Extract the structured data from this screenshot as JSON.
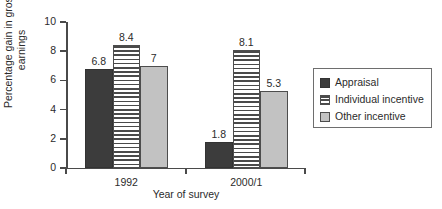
{
  "chart_data": {
    "type": "bar",
    "title": "",
    "subtitle": "",
    "xlabel": "Year of survey",
    "ylabel": "Percentage gain in gross\nearnings",
    "categories": [
      "1992",
      "2000/1"
    ],
    "series": [
      {
        "name": "Appraisal",
        "values": [
          6.8,
          1.8
        ],
        "labels": [
          "6.8",
          "1.8"
        ],
        "pattern": "solid",
        "color": "#3c3c3c"
      },
      {
        "name": "Individual incentive",
        "values": [
          8.4,
          8.1
        ],
        "labels": [
          "8.4",
          "8.1"
        ],
        "pattern": "horizontal-stripes",
        "color": "#4a4a4a"
      },
      {
        "name": "Other incentive",
        "values": [
          7,
          5.3
        ],
        "labels": [
          "7",
          "5.3"
        ],
        "pattern": "solid",
        "color": "#c2c2c2"
      }
    ],
    "ylim": [
      0,
      10
    ],
    "yticks": [
      0,
      2,
      4,
      6,
      8,
      10
    ],
    "ytick_labels": [
      "0",
      "2",
      "4",
      "6",
      "8",
      "10"
    ],
    "grid": false,
    "legend_position": "right",
    "legend_entries": [
      "Appraisal",
      "Individual incentive",
      "Other incentive"
    ],
    "background_color": "#ffffff",
    "axis_color": "#4a4a4a"
  }
}
